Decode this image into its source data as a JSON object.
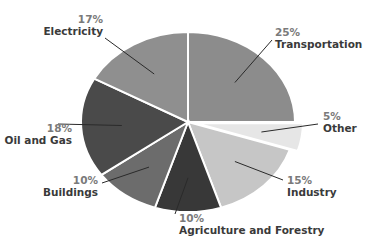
{
  "chart_data": {
    "type": "pie",
    "title": "",
    "start_angle_deg": 0,
    "direction": "clockwise",
    "categories": [
      "Transportation",
      "Other",
      "Industry",
      "Agriculture and Forestry",
      "Buildings",
      "Oil and Gas",
      "Electricity"
    ],
    "values": [
      25,
      5,
      15,
      10,
      10,
      18,
      17
    ],
    "unit": "%",
    "exploded": [
      "Other"
    ],
    "slices": [
      {
        "label": "Transportation",
        "value": 25,
        "pct_text": "25%",
        "color": "#8c8c8c"
      },
      {
        "label": "Other",
        "value": 5,
        "pct_text": "5%",
        "color": "#e6e6e6"
      },
      {
        "label": "Industry",
        "value": 15,
        "pct_text": "15%",
        "color": "#c6c6c6"
      },
      {
        "label": "Agriculture and Forestry",
        "value": 10,
        "pct_text": "10%",
        "color": "#383838"
      },
      {
        "label": "Buildings",
        "value": 10,
        "pct_text": "10%",
        "color": "#6c6c6c"
      },
      {
        "label": "Oil and Gas",
        "value": 18,
        "pct_text": "18%",
        "color": "#4a4a4a"
      },
      {
        "label": "Electricity",
        "value": 17,
        "pct_text": "17%",
        "color": "#8f8f8f"
      }
    ],
    "legend": "none (labels with leader lines)",
    "grid": false
  }
}
